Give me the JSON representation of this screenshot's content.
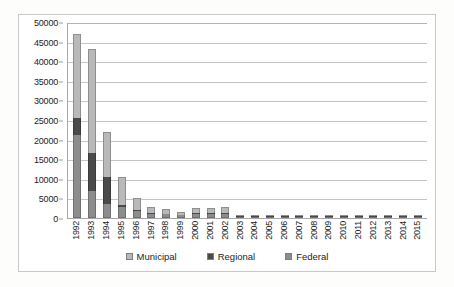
{
  "chart_data": {
    "type": "bar",
    "subtype": "stacked-column",
    "title": "",
    "xlabel": "",
    "ylabel": "",
    "ylim": [
      0,
      50000
    ],
    "ytick_step": 5000,
    "yticks": [
      0,
      5000,
      10000,
      15000,
      20000,
      25000,
      30000,
      35000,
      40000,
      45000,
      50000
    ],
    "ytick_labels": [
      "0",
      "5000",
      "10000",
      "15000",
      "20000",
      "25000",
      "30000",
      "35000",
      "40000",
      "45000",
      "50000"
    ],
    "grid": true,
    "legend_position": "bottom",
    "categories": [
      "1992",
      "1993",
      "1994",
      "1995",
      "1996",
      "1997",
      "1998",
      "1999",
      "2000",
      "2001",
      "2002",
      "2003",
      "2004",
      "2005",
      "2006",
      "2007",
      "2008",
      "2009",
      "2010",
      "2011",
      "2012",
      "2013",
      "2014",
      "2015"
    ],
    "series": [
      {
        "name": "Municipal",
        "color": "#b9b9b9",
        "values": [
          21500,
          26500,
          11500,
          7200,
          2900,
          1500,
          1100,
          700,
          1300,
          1250,
          1400,
          150,
          60,
          60,
          60,
          60,
          60,
          60,
          60,
          60,
          60,
          60,
          60,
          60
        ]
      },
      {
        "name": "Regional",
        "color": "#4a4a4a",
        "values": [
          4200,
          9500,
          7000,
          400,
          300,
          200,
          150,
          120,
          200,
          200,
          250,
          80,
          40,
          40,
          40,
          40,
          40,
          40,
          40,
          40,
          40,
          40,
          40,
          40
        ]
      },
      {
        "name": "Federal",
        "color": "#8d8d8d",
        "values": [
          21300,
          7000,
          3500,
          2900,
          1800,
          1100,
          950,
          680,
          1000,
          1050,
          1050,
          120,
          50,
          50,
          50,
          50,
          50,
          50,
          50,
          50,
          50,
          50,
          50,
          50
        ]
      }
    ],
    "totals": [
      47000,
      43000,
      22000,
      10500,
      5000,
      2800,
      2200,
      1500,
      2500,
      2500,
      2700,
      350,
      150,
      150,
      150,
      150,
      150,
      150,
      150,
      150,
      150,
      150,
      150,
      150
    ]
  },
  "legend": {
    "items": [
      {
        "label": "Municipal",
        "color": "#b9b9b9"
      },
      {
        "label": "Regional",
        "color": "#4a4a4a"
      },
      {
        "label": "Federal",
        "color": "#8d8d8d"
      }
    ]
  }
}
